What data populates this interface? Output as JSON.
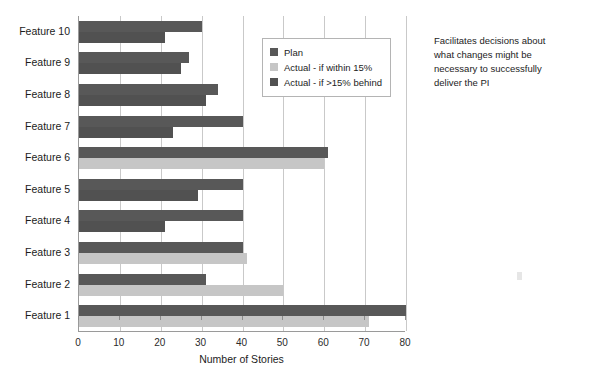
{
  "chart_data": {
    "type": "bar",
    "orientation": "horizontal",
    "title": "",
    "xlabel": "Number of Stories",
    "ylabel": "",
    "xlim": [
      0,
      80
    ],
    "xticks": [
      0,
      10,
      20,
      30,
      40,
      50,
      60,
      70,
      80
    ],
    "grid": true,
    "legend_position": "top-right-inside",
    "categories": [
      "Feature 10",
      "Feature 9",
      "Feature 8",
      "Feature 7",
      "Feature 6",
      "Feature 5",
      "Feature 4",
      "Feature 3",
      "Feature 2",
      "Feature 1"
    ],
    "series": [
      {
        "name": "Plan",
        "color": "#585858",
        "values": [
          30,
          27,
          34,
          40,
          61,
          40,
          40,
          40,
          31,
          80
        ]
      },
      {
        "name": "Actual - if within 15%",
        "color": "#c6c6c6",
        "values": [
          null,
          null,
          null,
          null,
          60,
          null,
          null,
          41,
          50,
          71
        ]
      },
      {
        "name": "Actual - if >15% behind",
        "color": "#515151",
        "values": [
          21,
          25,
          31,
          23,
          null,
          29,
          21,
          null,
          null,
          null
        ]
      }
    ]
  },
  "legend": {
    "items": [
      {
        "label": "Plan",
        "color": "#585858"
      },
      {
        "label": "Actual - if within 15%",
        "color": "#c6c6c6"
      },
      {
        "label": "Actual - if >15% behind",
        "color": "#515151"
      }
    ]
  },
  "annotation": {
    "lines": [
      "Facilitates decisions about",
      "what changes might be",
      "necessary to successfully",
      "deliver the PI"
    ]
  },
  "axis": {
    "x_title": "Number of Stories",
    "x_tick_labels": [
      "0",
      "10",
      "20",
      "30",
      "40",
      "50",
      "60",
      "70",
      "80"
    ]
  }
}
